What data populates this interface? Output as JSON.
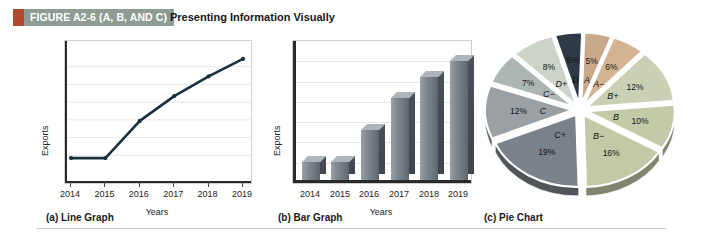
{
  "figure": {
    "number_label": "FIGURE A2-6 (A, B, AND C)",
    "title": "Presenting Information Visually",
    "mark_color": "#b04a2c",
    "banner_color": "#8e9c93"
  },
  "panels": [
    {
      "caption": "(a)  Line Graph"
    },
    {
      "caption": "(b)  Bar Graph"
    },
    {
      "caption": "(c)  Pie Chart"
    }
  ],
  "chart_data": [
    {
      "type": "line",
      "title": "",
      "xlabel": "Years",
      "ylabel": "Exports",
      "categories": [
        "2014",
        "2015",
        "2016",
        "2017",
        "2018",
        "2019"
      ],
      "values": [
        12,
        12,
        42,
        62,
        78,
        92
      ],
      "ylim": [
        0,
        100
      ],
      "xlim": [
        "2014",
        "2019"
      ],
      "grid": true,
      "legend": "none",
      "line_color": "#17303c",
      "marker": "dot",
      "caption": "(a)  Line Graph"
    },
    {
      "type": "bar",
      "title": "",
      "xlabel": "Years",
      "ylabel": "Exports",
      "categories": [
        "2014",
        "2015",
        "2016",
        "2017",
        "2018",
        "2019"
      ],
      "values": [
        14,
        14,
        38,
        62,
        78,
        90
      ],
      "ylim": [
        0,
        100
      ],
      "grid": true,
      "legend": "none",
      "bar_color": "#7e858c",
      "caption": "(b)  Bar Graph"
    },
    {
      "type": "pie",
      "title": "",
      "legend": "labels-on-slices",
      "caption": "(c)  Pie Chart",
      "labels": [
        "A",
        "A−",
        "B+",
        "B",
        "B−",
        "C+",
        "C",
        "C−",
        "D+",
        "D"
      ],
      "values": [
        5,
        6,
        12,
        10,
        16,
        19,
        12,
        7,
        8,
        5
      ],
      "value_labels": [
        "5%",
        "6%",
        "12%",
        "10%",
        "16%",
        "19%",
        "12%",
        "7%",
        "8%",
        "5%"
      ],
      "colors": [
        "#c9a989",
        "#d3b391",
        "#c9d0b4",
        "#c2caa8",
        "#c3c8a6",
        "#7b8188",
        "#9aa0a4",
        "#aeb6b4",
        "#ccd3c9",
        "#2e3a46"
      ]
    }
  ]
}
